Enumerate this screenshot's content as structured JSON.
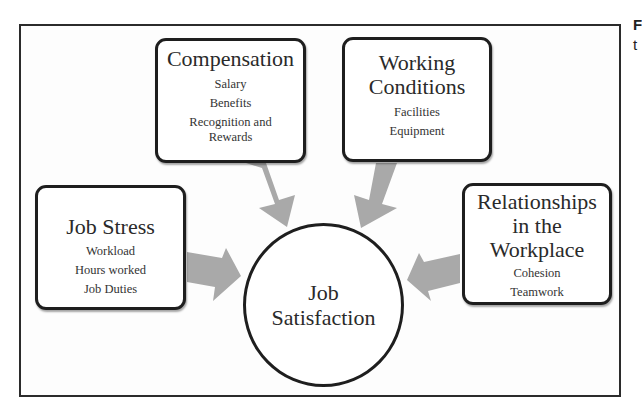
{
  "diagram": {
    "center": {
      "title_line1": "Job",
      "title_line2": "Satisfaction"
    },
    "factors": [
      {
        "title": "Compensation",
        "items": [
          "Salary",
          "Benefits",
          "Recognition and Rewards"
        ]
      },
      {
        "title_line1": "Working",
        "title_line2": "Conditions",
        "items": [
          "Facilities",
          "Equipment"
        ]
      },
      {
        "title": "Job Stress",
        "items": [
          "Workload",
          "Hours worked",
          "Job Duties"
        ]
      },
      {
        "title_line1": "Relationships",
        "title_line2": "in the",
        "title_line3": "Workplace",
        "items": [
          "Cohesion",
          "Teamwork"
        ]
      }
    ],
    "arrow_color": "#a9a9a9",
    "border_color": "#1e1e1e"
  },
  "side_text": {
    "line1": "F",
    "line2": "t"
  }
}
